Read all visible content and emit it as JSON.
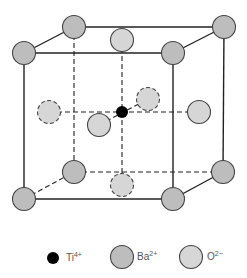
{
  "diagram": {
    "colors": {
      "edge": "#222222",
      "ba_fill": "#bdbdbd",
      "o_fill": "#d6d6d6",
      "ti_fill": "#000000",
      "outline": "#444444"
    },
    "ion_radius": 11.5,
    "ti_radius": 6,
    "cube": {
      "front_top_left": [
        24,
        53
      ],
      "front_top_right": [
        173,
        53
      ],
      "front_bottom_left": [
        24,
        199
      ],
      "front_bottom_right": [
        173,
        199
      ],
      "back_top_left": [
        74,
        27
      ],
      "back_top_right": [
        224,
        27
      ],
      "back_bottom_left": [
        74,
        172
      ],
      "back_bottom_right": [
        223,
        172
      ]
    },
    "solid_edges": [
      [
        "front_top_left",
        "front_top_right"
      ],
      [
        "front_top_right",
        "front_bottom_right"
      ],
      [
        "front_bottom_right",
        "front_bottom_left"
      ],
      [
        "front_bottom_left",
        "front_top_left"
      ],
      [
        "front_top_left",
        "back_top_left"
      ],
      [
        "back_top_left",
        "back_top_right"
      ],
      [
        "front_top_right",
        "back_top_right"
      ],
      [
        "back_top_right",
        "back_bottom_right"
      ],
      [
        "front_bottom_right",
        "back_bottom_right"
      ]
    ],
    "dashed_edges": [
      [
        "back_top_left",
        "back_bottom_left"
      ],
      [
        "back_bottom_left",
        "back_bottom_right"
      ],
      [
        "front_bottom_left",
        "back_bottom_left"
      ]
    ],
    "interior_dashed_lines": [
      [
        [
          122,
          40
        ],
        [
          122,
          185
        ]
      ],
      [
        [
          49,
          112
        ],
        [
          199,
          112
        ]
      ],
      [
        [
          99,
          125
        ],
        [
          148,
          99
        ]
      ]
    ],
    "ions": [
      {
        "id": "ba-back-top-left",
        "type": "Ba",
        "pos": [
          74,
          27
        ],
        "outline": "solid"
      },
      {
        "id": "ba-back-top-right",
        "type": "Ba",
        "pos": [
          224,
          27
        ],
        "outline": "solid"
      },
      {
        "id": "o-top-face",
        "type": "O",
        "pos": [
          122,
          40
        ],
        "outline": "solid"
      },
      {
        "id": "ba-front-top-left",
        "type": "Ba",
        "pos": [
          24,
          53
        ],
        "outline": "solid"
      },
      {
        "id": "ba-front-top-right",
        "type": "Ba",
        "pos": [
          173,
          53
        ],
        "outline": "solid"
      },
      {
        "id": "o-back-face",
        "type": "O",
        "pos": [
          148,
          99
        ],
        "outline": "dashed"
      },
      {
        "id": "o-left-face",
        "type": "O",
        "pos": [
          49,
          112
        ],
        "outline": "dashed"
      },
      {
        "id": "o-right-face",
        "type": "O",
        "pos": [
          199,
          112
        ],
        "outline": "solid"
      },
      {
        "id": "ti-center",
        "type": "Ti",
        "pos": [
          122,
          112
        ],
        "outline": "solid"
      },
      {
        "id": "o-front-face",
        "type": "O",
        "pos": [
          99,
          125
        ],
        "outline": "solid"
      },
      {
        "id": "ba-back-bottom-left",
        "type": "Ba",
        "pos": [
          74,
          172
        ],
        "outline": "solid"
      },
      {
        "id": "ba-back-bottom-right",
        "type": "Ba",
        "pos": [
          223,
          172
        ],
        "outline": "solid"
      },
      {
        "id": "o-bottom-face",
        "type": "O",
        "pos": [
          122,
          185
        ],
        "outline": "dashed"
      },
      {
        "id": "ba-front-bottom-left",
        "type": "Ba",
        "pos": [
          24,
          199
        ],
        "outline": "solid"
      },
      {
        "id": "ba-front-bottom-right",
        "type": "Ba",
        "pos": [
          173,
          199
        ],
        "outline": "solid"
      }
    ]
  },
  "legend": {
    "items": [
      {
        "symbol": "Ti",
        "charge": "4+",
        "type": "Ti",
        "marker_pos": [
          53,
          258
        ],
        "label_pos": [
          66,
          252
        ]
      },
      {
        "symbol": "Ba",
        "charge": "2+",
        "type": "Ba",
        "marker_pos": [
          122,
          257
        ],
        "label_pos": [
          137,
          251
        ]
      },
      {
        "symbol": "O",
        "charge": "2−",
        "type": "O",
        "marker_pos": [
          191,
          257
        ],
        "label_pos": [
          207,
          251
        ]
      }
    ]
  }
}
